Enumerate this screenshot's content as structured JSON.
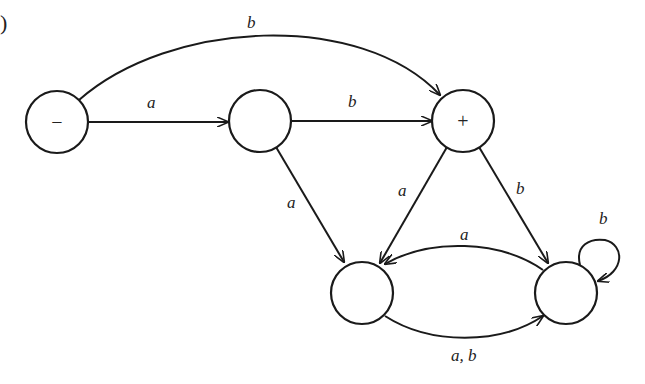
{
  "figure": {
    "corner_mark": ")",
    "nodes": [
      {
        "id": "n0",
        "label": "−",
        "role": "start"
      },
      {
        "id": "n1",
        "label": ""
      },
      {
        "id": "n2",
        "label": "+",
        "role": "final"
      },
      {
        "id": "n3",
        "label": ""
      },
      {
        "id": "n4",
        "label": ""
      }
    ],
    "edges": [
      {
        "from": "n0",
        "to": "n2",
        "label": "b"
      },
      {
        "from": "n0",
        "to": "n1",
        "label": "a"
      },
      {
        "from": "n1",
        "to": "n2",
        "label": "b"
      },
      {
        "from": "n1",
        "to": "n3",
        "label": "a"
      },
      {
        "from": "n2",
        "to": "n3",
        "label": "a"
      },
      {
        "from": "n2",
        "to": "n4",
        "label": "b"
      },
      {
        "from": "n4",
        "to": "n3",
        "label": "a"
      },
      {
        "from": "n3",
        "to": "n4",
        "label": "a, b"
      },
      {
        "from": "n4",
        "to": "n4",
        "label": "b"
      }
    ]
  }
}
